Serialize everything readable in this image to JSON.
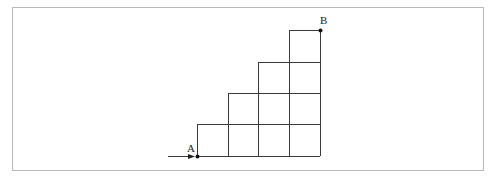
{
  "diagram": {
    "type": "staircase-grid",
    "colors": {
      "line": "#3a3a3a",
      "frame": "#b8b8b8",
      "background": "#ffffff",
      "point": "#111111"
    },
    "grid": {
      "x_lines": [
        197,
        228,
        258,
        289,
        320
      ],
      "y_lines": [
        30,
        62,
        93,
        124,
        156
      ],
      "rows": [
        {
          "name": "row-1",
          "cells": 4
        },
        {
          "name": "row-2",
          "cells": 3
        },
        {
          "name": "row-3",
          "cells": 2
        },
        {
          "name": "row-4",
          "cells": 1
        }
      ]
    },
    "points": {
      "start": {
        "label": "A",
        "x": 197,
        "y": 156
      },
      "end": {
        "label": "B",
        "x": 320,
        "y": 30
      }
    },
    "arrow": {
      "from_x": 168,
      "to_x": 194,
      "y": 156
    }
  }
}
